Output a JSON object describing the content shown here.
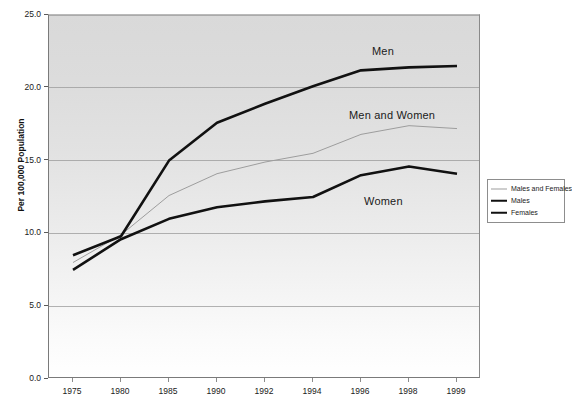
{
  "chart_data": {
    "type": "line",
    "title": "",
    "xlabel": "",
    "ylabel": "Per 100,000 Population",
    "categories": [
      "1975",
      "1980",
      "1985",
      "1990",
      "1992",
      "1994",
      "1996",
      "1998",
      "1999"
    ],
    "ylim": [
      0.0,
      25.0
    ],
    "ytick_labels": [
      "0.0",
      "5.0",
      "10.0",
      "15.0",
      "20.0",
      "25.0"
    ],
    "ytick_values": [
      0.0,
      5.0,
      10.0,
      15.0,
      20.0,
      25.0
    ],
    "grid": "horizontal",
    "legend_position": "right",
    "series": [
      {
        "name": "Males and Females",
        "annotation": "Men and Women",
        "color": "#9d9d9d",
        "width": 1,
        "values": [
          8.0,
          9.9,
          12.6,
          14.1,
          14.9,
          15.5,
          16.8,
          17.4,
          17.2
        ]
      },
      {
        "name": "Males",
        "annotation": "Men",
        "color": "#111111",
        "width": 2.6,
        "values": [
          8.5,
          9.8,
          15.0,
          17.6,
          18.9,
          20.1,
          21.2,
          21.4,
          21.5
        ]
      },
      {
        "name": "Females",
        "annotation": "Women",
        "color": "#111111",
        "width": 2.6,
        "values": [
          7.5,
          9.6,
          11.0,
          11.8,
          12.2,
          12.5,
          14.0,
          14.6,
          14.1
        ]
      }
    ],
    "annotations": [
      {
        "text": "Men",
        "x_px": 371,
        "y_px": 44
      },
      {
        "text": "Men and Women",
        "x_px": 348,
        "y_px": 108
      },
      {
        "text": "Women",
        "x_px": 363,
        "y_px": 194
      }
    ]
  },
  "legend": {
    "items": [
      {
        "label": "Males and Females",
        "swatch": "thin-gray-line"
      },
      {
        "label": "Males",
        "swatch": "thick-black-line"
      },
      {
        "label": "Females",
        "swatch": "thick-black-line"
      }
    ]
  }
}
